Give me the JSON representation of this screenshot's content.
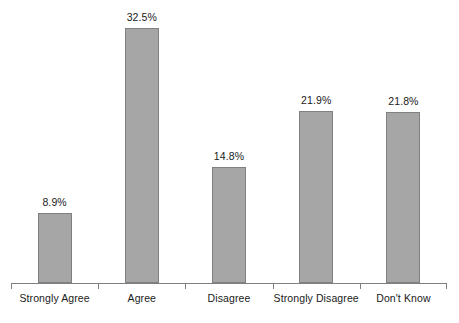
{
  "chart_data": {
    "type": "bar",
    "title": "",
    "subtitle": "",
    "xlabel": "",
    "ylabel": "",
    "categories": [
      "Strongly Agree",
      "Agree",
      "Disagree",
      "Strongly Disagree",
      "Don't Know"
    ],
    "values": [
      8.9,
      32.5,
      14.8,
      21.9,
      21.8
    ],
    "data_labels": [
      "8.9%",
      "32.5%",
      "14.8%",
      "21.9%",
      "21.8%"
    ],
    "ylim": [
      0,
      36
    ],
    "grid": false,
    "legend": false,
    "y_axis_visible": false,
    "x_axis_visible": true,
    "colors": {
      "bar_fill": "#a6a6a6",
      "bar_border": "#808080",
      "axis": "#7f7f7f",
      "text": "#1a1a1a",
      "background": "#ffffff"
    }
  }
}
